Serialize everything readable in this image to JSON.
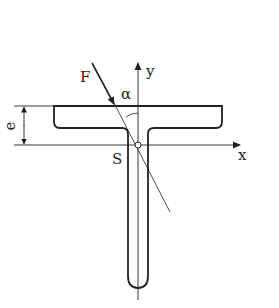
{
  "diagram": {
    "type": "T-beam cross-section with inclined force",
    "labels": {
      "force": "F",
      "angle": "α",
      "y_axis": "y",
      "x_axis": "x",
      "centroid": "S",
      "distance": "e"
    },
    "colors": {
      "stroke": "#222222",
      "background": "#ffffff"
    }
  }
}
